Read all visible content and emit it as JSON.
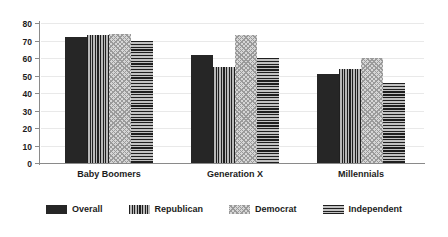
{
  "chart_data": {
    "type": "bar",
    "title": "",
    "subtitle": "",
    "xlabel": "",
    "ylabel": "",
    "ylim": [
      0,
      80
    ],
    "ytick_step": 10,
    "yticks": [
      "80",
      "70",
      "60",
      "50",
      "40",
      "30",
      "20",
      "10",
      "0"
    ],
    "grid": true,
    "legend_position": "bottom",
    "categories": [
      "Baby Boomers",
      "Generation X",
      "Millennials"
    ],
    "series": [
      {
        "name": "Overall",
        "pattern": "solid",
        "color": "#262626",
        "values": [
          72,
          62,
          51
        ]
      },
      {
        "name": "Republican",
        "pattern": "vertical-stripes",
        "color": "#6e6e6e",
        "values": [
          73,
          55,
          54
        ]
      },
      {
        "name": "Democrat",
        "pattern": "diagonal-hatch",
        "color": "#d6d6d6",
        "values": [
          74,
          73,
          60
        ]
      },
      {
        "name": "Independent",
        "pattern": "horizontal-stripes",
        "color": "#707070",
        "values": [
          70,
          60,
          46
        ]
      }
    ]
  },
  "axis": {
    "y_max_label": "80",
    "y_min_label": "0"
  },
  "legend": {
    "items": [
      {
        "label": "Overall"
      },
      {
        "label": "Republican"
      },
      {
        "label": "Democrat"
      },
      {
        "label": "Independent"
      }
    ]
  }
}
